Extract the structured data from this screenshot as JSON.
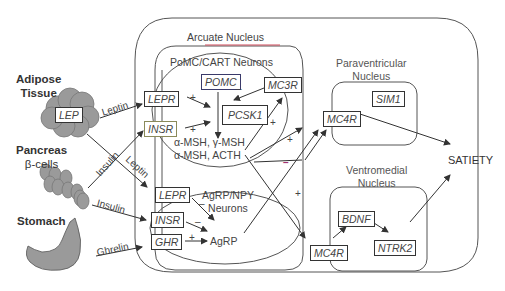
{
  "sources": {
    "adipose": {
      "label_line1": "Adipose",
      "label_line2": "Tissue",
      "gene": "LEP"
    },
    "pancreas": {
      "label_line1": "Pancreas",
      "label_line2": "β-cells"
    },
    "stomach": {
      "label": "Stomach"
    }
  },
  "edges": {
    "leptin_top": "Leptin",
    "insulin_diag": "Insulin",
    "leptin_diag": "Leptin",
    "insulin_low": "Insulin",
    "ghrelin": "Ghrelin"
  },
  "arcuate": {
    "title": "Arcuate Nucleus",
    "pomc_group": {
      "title": "PoMC/CART Neurons",
      "genes": {
        "lepr": "LEPR",
        "insr": "INSR",
        "pomc": "POMC",
        "mc3r": "MC3R",
        "pcsk1": "PCSK1"
      },
      "products_line1": "α-MSH, γ-MSH",
      "products_line2": "α-MSH, ACTH"
    },
    "agrp_group": {
      "title_line1": "AgRP/NPY",
      "title_line2": "Neurons",
      "genes": {
        "lepr": "LEPR",
        "insr": "INSR",
        "ghr": "GHR"
      },
      "product": "AgRP"
    }
  },
  "paraventricular": {
    "title_line1": "Paraventricular",
    "title_line2": "Nucleus",
    "genes": {
      "sim1": "SIM1",
      "mc4r": "MC4R"
    }
  },
  "ventromedial": {
    "title_line1": "Ventromedial",
    "title_line2": "Nucleus",
    "genes": {
      "mc4r": "MC4R",
      "bdnf": "BDNF",
      "ntrk2": "NTRK2"
    }
  },
  "outcome": {
    "label": "SATIETY"
  },
  "signs": {
    "plus": "+",
    "minus": "–"
  },
  "colors": {
    "line": "#555555",
    "arcuate_accent": "#d04a5a",
    "tissue_fill": "#9a9a9a",
    "minus_accent": "#a03070"
  }
}
